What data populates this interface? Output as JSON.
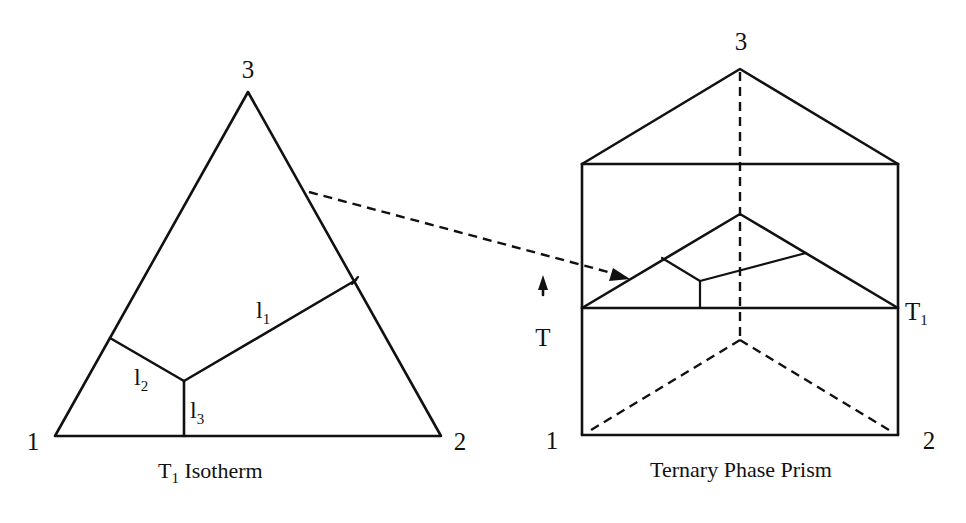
{
  "figure": {
    "type": "ternary_phase_diagram_illustration",
    "left_panel": {
      "caption": {
        "main": "T",
        "sub": "1",
        "rest": " Isotherm"
      },
      "vertices": {
        "v1": "1",
        "v2": "2",
        "v3": "3"
      },
      "boundary_lines": [
        {
          "id": "l1",
          "label": "l",
          "sub": "1"
        },
        {
          "id": "l2",
          "label": "l",
          "sub": "2"
        },
        {
          "id": "l3",
          "label": "l",
          "sub": "3"
        }
      ]
    },
    "right_panel": {
      "caption": "Ternary Phase Prism",
      "vertices": {
        "v1": "1",
        "v2": "2",
        "v3": "3"
      },
      "temperature_axis": {
        "label": "T",
        "direction": "up"
      },
      "isotherm_level": {
        "main": "T",
        "sub": "1"
      }
    },
    "connector": {
      "style": "dashed-arrow",
      "from": "left isotherm triangle",
      "to": "isotherm section in prism"
    },
    "colors": {
      "line": "#111111",
      "background": "#ffffff"
    }
  }
}
